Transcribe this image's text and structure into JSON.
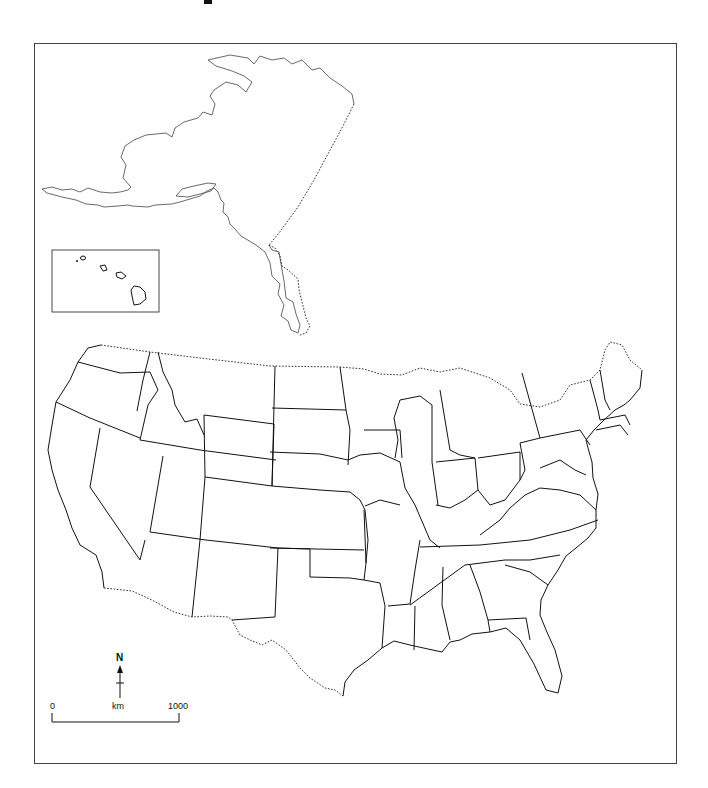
{
  "map": {
    "type": "outline-map",
    "region": "United States",
    "insets": [
      "Alaska",
      "Hawaii"
    ],
    "state_labels": []
  },
  "compass": {
    "label": "N",
    "icon": "north-arrow-icon"
  },
  "scale_bar": {
    "start_label": "0",
    "unit_label": "km",
    "end_label": "1000"
  },
  "colors": {
    "background": "#ffffff",
    "line": "#111111",
    "frame": "#444444"
  }
}
